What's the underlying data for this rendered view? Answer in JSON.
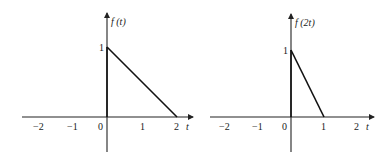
{
  "plots": [
    {
      "id": "f_t",
      "ylabel": "f (t)",
      "xlabel": "t",
      "ytick": "1",
      "xticks": [
        "−2",
        "−1",
        "0",
        "1",
        "2"
      ],
      "segment": {
        "from": [
          0,
          1
        ],
        "to": [
          2,
          0
        ]
      }
    },
    {
      "id": "f_2t",
      "ylabel": "f (2t)",
      "xlabel": "t",
      "ytick": "1",
      "xticks": [
        "−2",
        "−1",
        "0",
        "1",
        "2"
      ],
      "segment": {
        "from": [
          0,
          1
        ],
        "to": [
          1,
          0
        ]
      }
    }
  ]
}
